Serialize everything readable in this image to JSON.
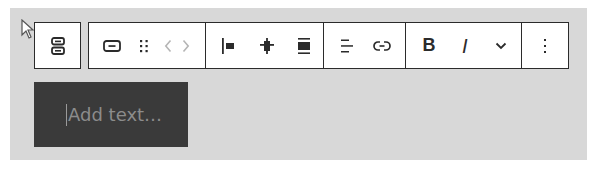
{
  "editor": {
    "background_color": "#d8d8d8",
    "toolbar": {
      "parent_block": {
        "icon": "group-stack-icon",
        "label": "Select parent block"
      },
      "groups": [
        {
          "name": "block-controls",
          "items": [
            {
              "icon": "button-block-icon",
              "label": "Button"
            },
            {
              "icon": "drag-handle-icon",
              "label": "Drag"
            },
            {
              "icon": "chevron-left-icon",
              "label": "Move left"
            },
            {
              "icon": "chevron-right-icon",
              "label": "Move right"
            }
          ]
        },
        {
          "name": "alignment",
          "items": [
            {
              "icon": "justify-left-icon",
              "label": "Justify items left"
            },
            {
              "icon": "justify-center-icon",
              "label": "Justify items center"
            },
            {
              "icon": "justify-stretch-icon",
              "label": "Stretch items"
            }
          ]
        },
        {
          "name": "text-controls",
          "items": [
            {
              "icon": "align-text-icon",
              "label": "Align text"
            },
            {
              "icon": "link-icon",
              "label": "Link"
            }
          ]
        },
        {
          "name": "formatting",
          "items": [
            {
              "icon": "bold-icon",
              "label": "B"
            },
            {
              "icon": "italic-icon",
              "label": "I"
            },
            {
              "icon": "chevron-down-icon",
              "label": "More"
            }
          ]
        },
        {
          "name": "options",
          "items": [
            {
              "icon": "more-vertical-icon",
              "label": "Options"
            }
          ]
        }
      ]
    },
    "button_block": {
      "placeholder": "Add text…",
      "background_color": "#3a3a3a"
    }
  }
}
